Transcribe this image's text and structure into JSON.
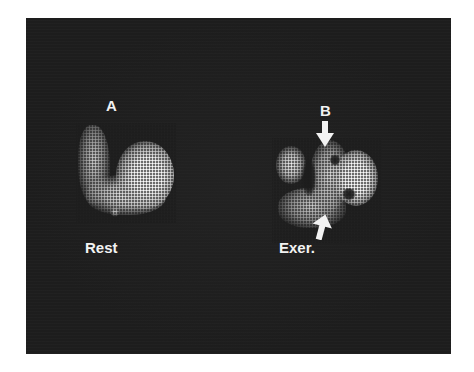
{
  "figure": {
    "background_color": "#1d1d1d",
    "panels": [
      {
        "id": "A",
        "label": "A",
        "caption": "Rest"
      },
      {
        "id": "B",
        "label": "B",
        "caption": "Exer.",
        "arrows": [
          "arrow-down-top",
          "arrow-up-bottom"
        ]
      }
    ]
  }
}
